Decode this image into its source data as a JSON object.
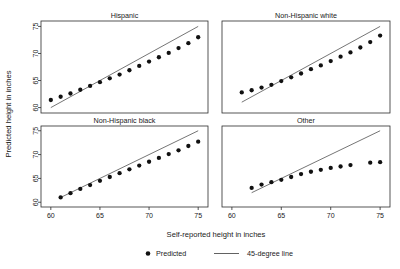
{
  "chart_data": {
    "type": "scatter",
    "title": "",
    "xlabel": "Self-reported height in inches",
    "ylabel": "Predicted height in inches",
    "xlim": [
      59,
      76
    ],
    "ylim": [
      59,
      76
    ],
    "xticks": [
      60,
      65,
      70,
      75
    ],
    "yticks": [
      60,
      65,
      70,
      75
    ],
    "grid": false,
    "legend_position": "bottom",
    "legend": [
      {
        "key": "predicted",
        "label": "Predicted",
        "marker": "filled-circle",
        "color": "#111111"
      },
      {
        "key": "reference",
        "label": "45-degree line",
        "marker": "line",
        "color": "#3a3a3a"
      }
    ],
    "panel_layout": {
      "rows": 2,
      "cols": 2
    },
    "panels": [
      {
        "id": "hispanic",
        "title": "Hispanic",
        "position": "top-left",
        "series": [
          {
            "name": "Predicted",
            "x": [
              60,
              61,
              62,
              63,
              64,
              65,
              66,
              67,
              68,
              69,
              70,
              71,
              72,
              73,
              74,
              75
            ],
            "y": [
              61.4,
              62.0,
              62.6,
              63.3,
              64.0,
              64.7,
              65.4,
              66.1,
              66.9,
              67.7,
              68.5,
              69.3,
              70.1,
              71.0,
              71.9,
              73.0
            ]
          }
        ],
        "reference_line": {
          "name": "45-degree line",
          "x": [
            60,
            75
          ],
          "y": [
            60,
            75
          ]
        }
      },
      {
        "id": "non-hispanic-white",
        "title": "Non-Hispanic white",
        "position": "top-right",
        "series": [
          {
            "name": "Predicted",
            "x": [
              61,
              62,
              63,
              64,
              65,
              66,
              67,
              68,
              69,
              70,
              71,
              72,
              73,
              74,
              75
            ],
            "y": [
              62.8,
              63.2,
              63.7,
              64.2,
              64.9,
              65.6,
              66.3,
              67.1,
              67.8,
              68.6,
              69.4,
              70.2,
              71.1,
              72.1,
              73.3
            ]
          }
        ],
        "reference_line": {
          "name": "45-degree line",
          "x": [
            61,
            75
          ],
          "y": [
            61,
            75
          ]
        }
      },
      {
        "id": "non-hispanic-black",
        "title": "Non-Hispanic black",
        "position": "bottom-left",
        "series": [
          {
            "name": "Predicted",
            "x": [
              61,
              62,
              63,
              64,
              65,
              66,
              67,
              68,
              69,
              70,
              71,
              72,
              73,
              74,
              75
            ],
            "y": [
              61.0,
              61.9,
              62.8,
              63.6,
              64.5,
              65.3,
              66.1,
              66.9,
              67.7,
              68.5,
              69.3,
              70.1,
              70.9,
              71.8,
              72.7
            ]
          }
        ],
        "reference_line": {
          "name": "45-degree line",
          "x": [
            61,
            75
          ],
          "y": [
            61,
            75
          ]
        }
      },
      {
        "id": "other",
        "title": "Other",
        "position": "bottom-right",
        "series": [
          {
            "name": "Predicted",
            "x": [
              62,
              63,
              64,
              65,
              66,
              67,
              68,
              69,
              70,
              71,
              72,
              74,
              75
            ],
            "y": [
              63.0,
              63.7,
              64.2,
              64.7,
              65.3,
              65.9,
              66.4,
              66.8,
              67.2,
              67.5,
              67.8,
              68.3,
              68.4
            ]
          }
        ],
        "reference_line": {
          "name": "45-degree line",
          "x": [
            62,
            75
          ],
          "y": [
            62,
            75
          ]
        }
      }
    ]
  },
  "axes": {
    "y_title": "Predicted height in inches",
    "x_title": "Self-reported height in inches",
    "y_tick_labels": [
      "60",
      "65",
      "70",
      "75"
    ],
    "x_tick_labels": [
      "60",
      "65",
      "70",
      "75"
    ]
  },
  "panel_titles": {
    "top_left": "Hispanic",
    "top_right": "Non-Hispanic white",
    "bottom_left": "Non-Hispanic black",
    "bottom_right": "Other"
  },
  "legend": {
    "predicted_label": "Predicted",
    "reference_label": "45-degree line"
  },
  "colors": {
    "marker": "#111111",
    "line": "#3a3a3a",
    "frame": "#2b2b2b",
    "background": "#ffffff",
    "text": "#1a1a1a"
  }
}
